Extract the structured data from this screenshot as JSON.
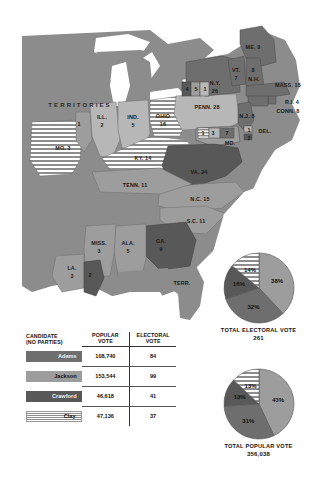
{
  "map": {
    "territories_label": "TERRITORIES",
    "states": [
      {
        "name": "ME. 9",
        "x": 253,
        "y": 47
      },
      {
        "name": "VT.",
        "x": 236,
        "y": 70
      },
      {
        "name": "7",
        "x": 236,
        "y": 78
      },
      {
        "name": "8",
        "x": 253,
        "y": 70
      },
      {
        "name": "N.H.",
        "x": 254,
        "y": 79
      },
      {
        "name": "MASS. 15",
        "x": 288,
        "y": 85
      },
      {
        "name": "N.Y.",
        "x": 215,
        "y": 83
      },
      {
        "name": "26",
        "x": 215,
        "y": 91
      },
      {
        "name": "4",
        "x": 187,
        "y": 89
      },
      {
        "name": "5",
        "x": 196,
        "y": 89
      },
      {
        "name": "1",
        "x": 205,
        "y": 89
      },
      {
        "name": "R.I. 4",
        "x": 292,
        "y": 102
      },
      {
        "name": "CONN. 8",
        "x": 288,
        "y": 111
      },
      {
        "name": "PENN. 28",
        "x": 207,
        "y": 107
      },
      {
        "name": "N.J. 8",
        "x": 247,
        "y": 116
      },
      {
        "name": "1",
        "x": 249,
        "y": 130
      },
      {
        "name": "DEL.",
        "x": 265,
        "y": 131
      },
      {
        "name": "2",
        "x": 249,
        "y": 138
      },
      {
        "name": "1",
        "x": 203,
        "y": 133
      },
      {
        "name": "3",
        "x": 213,
        "y": 133
      },
      {
        "name": "7",
        "x": 227,
        "y": 133
      },
      {
        "name": "MD.",
        "x": 230,
        "y": 143
      },
      {
        "name": "ILL.",
        "x": 102,
        "y": 117
      },
      {
        "name": "2",
        "x": 102,
        "y": 125
      },
      {
        "name": "IND.",
        "x": 133,
        "y": 117
      },
      {
        "name": "5",
        "x": 133,
        "y": 125
      },
      {
        "name": "OHIO",
        "x": 163,
        "y": 116
      },
      {
        "name": "16",
        "x": 163,
        "y": 124
      },
      {
        "name": "1",
        "x": 79,
        "y": 124
      },
      {
        "name": "MO. 3",
        "x": 63,
        "y": 148
      },
      {
        "name": "KY. 14",
        "x": 143,
        "y": 158
      },
      {
        "name": "VA. 24",
        "x": 199,
        "y": 172
      },
      {
        "name": "TENN. 11",
        "x": 135,
        "y": 185
      },
      {
        "name": "N.C. 15",
        "x": 200,
        "y": 199
      },
      {
        "name": "S.C. 11",
        "x": 196,
        "y": 221
      },
      {
        "name": "MISS.",
        "x": 99,
        "y": 243
      },
      {
        "name": "3",
        "x": 99,
        "y": 251
      },
      {
        "name": "ALA.",
        "x": 128,
        "y": 243
      },
      {
        "name": "5",
        "x": 128,
        "y": 251
      },
      {
        "name": "GA.",
        "x": 161,
        "y": 241
      },
      {
        "name": "9",
        "x": 161,
        "y": 249
      },
      {
        "name": "LA.",
        "x": 72,
        "y": 268
      },
      {
        "name": "3",
        "x": 72,
        "y": 276
      },
      {
        "name": "2",
        "x": 90,
        "y": 275
      },
      {
        "name": "TERR.",
        "x": 182,
        "y": 283
      }
    ]
  },
  "table": {
    "headers": {
      "candidate_line1": "CANDIDATE",
      "candidate_line2": "(NO PARTIES)",
      "popular_line1": "POPULAR",
      "popular_line2": "VOTE",
      "electoral_line1": "ELECTORAL",
      "electoral_line2": "VOTE"
    },
    "rows": [
      {
        "candidate": "Adams",
        "popular_vote": "108,740",
        "electoral_vote": "84",
        "swatch": "#6e6e6e",
        "swatch_type": "solid",
        "text_light": true
      },
      {
        "candidate": "Jackson",
        "popular_vote": "153,544",
        "electoral_vote": "99",
        "swatch": "#9d9d9d",
        "swatch_type": "solid",
        "text_light": false
      },
      {
        "candidate": "Crawford",
        "popular_vote": "46,618",
        "electoral_vote": "41",
        "swatch": "#585858",
        "swatch_type": "solid",
        "text_light": true
      },
      {
        "candidate": "Clay",
        "popular_vote": "47,136",
        "electoral_vote": "37",
        "swatch": "#ffffff",
        "swatch_type": "stripes",
        "text_light": false
      }
    ]
  },
  "chart_data": [
    {
      "type": "pie",
      "title": "TOTAL ELECTORAL VOTE",
      "total": "261",
      "categories": [
        "Jackson",
        "Adams",
        "Crawford",
        "Clay"
      ],
      "values": [
        38,
        32,
        16,
        14
      ],
      "labels": [
        "38%",
        "32%",
        "16%",
        "14%"
      ],
      "colors": [
        "#9d9d9d",
        "#6e6e6e",
        "#585858",
        "#ffffff"
      ],
      "slice_fills": [
        "solid",
        "solid",
        "solid",
        "stripes"
      ],
      "legend": "none"
    },
    {
      "type": "pie",
      "title": "TOTAL POPULAR VOTE",
      "total": "356,038",
      "categories": [
        "Jackson",
        "Adams",
        "Crawford",
        "Clay"
      ],
      "values": [
        43,
        31,
        13,
        13
      ],
      "labels": [
        "43%",
        "31%",
        "13%",
        "13%"
      ],
      "colors": [
        "#9d9d9d",
        "#6e6e6e",
        "#585858",
        "#ffffff"
      ],
      "slice_fills": [
        "solid",
        "solid",
        "solid",
        "stripes"
      ],
      "legend": "none"
    }
  ],
  "colors": {
    "adams": "#6e6e6e",
    "jackson": "#9d9d9d",
    "crawford": "#585858",
    "clay_stripes": "#ffffff",
    "territories": "#8c8c8c",
    "water": "#ffffff"
  }
}
